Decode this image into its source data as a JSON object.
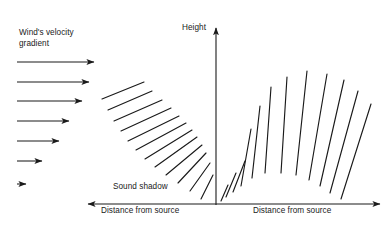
{
  "figure": {
    "title_absent": true,
    "background_color": "#ffffff",
    "stroke_color": "#1a1a1a",
    "text_color": "#1a1a1a"
  },
  "labels": {
    "wind_gradient": "Wind's velocity\ngradient",
    "height_axis": "Height",
    "sound_shadow": "Sound shadow",
    "distance_left": "Distance from source",
    "distance_right": "Distance from source"
  },
  "axes": {
    "vertical": {
      "x": 216,
      "y_top": 28,
      "y_bottom": 205,
      "arrow": "up",
      "label": "Height"
    },
    "horizontal_left": {
      "y": 204,
      "x_start": 216,
      "x_end": 88,
      "arrow": "left",
      "label": "Distance from source"
    },
    "horizontal_right": {
      "y": 204,
      "x_start": 216,
      "x_end": 380,
      "arrow": "right",
      "label": "Distance from source"
    }
  },
  "chart_data": {
    "type": "diagram",
    "wind_arrows": {
      "count": 7,
      "x_start": 17,
      "arrow_lengths": [
        77,
        72,
        65,
        52,
        42,
        25,
        9
      ],
      "y_positions": [
        62,
        82,
        101,
        121,
        141,
        161,
        184
      ],
      "meaning": "wind speed decreasing with decreasing height"
    },
    "left_fan": {
      "label": "Sound shadow",
      "ray_count": 12,
      "description": "Wavefront segments tilting from shallow at top-left to steep near the origin, bending upward away from the ground.",
      "rays": [
        {
          "x1": 102,
          "y1": 99,
          "x2": 144,
          "y2": 82
        },
        {
          "x1": 108,
          "y1": 110,
          "x2": 152,
          "y2": 91
        },
        {
          "x1": 114,
          "y1": 121,
          "x2": 162,
          "y2": 100
        },
        {
          "x1": 121,
          "y1": 131,
          "x2": 171,
          "y2": 108
        },
        {
          "x1": 128,
          "y1": 141,
          "x2": 179,
          "y2": 116
        },
        {
          "x1": 136,
          "y1": 150,
          "x2": 186,
          "y2": 123
        },
        {
          "x1": 145,
          "y1": 159,
          "x2": 192,
          "y2": 130
        },
        {
          "x1": 155,
          "y1": 167,
          "x2": 197,
          "y2": 137
        },
        {
          "x1": 166,
          "y1": 175,
          "x2": 202,
          "y2": 145
        },
        {
          "x1": 178,
          "y1": 183,
          "x2": 206,
          "y2": 153
        },
        {
          "x1": 190,
          "y1": 191,
          "x2": 210,
          "y2": 163
        },
        {
          "x1": 201,
          "y1": 199,
          "x2": 213,
          "y2": 175
        }
      ]
    },
    "right_fan": {
      "ray_count": 12,
      "origin": {
        "x": 219,
        "y": 203
      },
      "description": "Wavefront segments radiating from the source, arcing over and bending back down toward the ground downwind.",
      "rays": [
        {
          "x1": 221,
          "y1": 201,
          "x2": 228,
          "y2": 185
        },
        {
          "x1": 226,
          "y1": 197,
          "x2": 236,
          "y2": 173
        },
        {
          "x1": 233,
          "y1": 192,
          "x2": 245,
          "y2": 161
        },
        {
          "x1": 241,
          "y1": 186,
          "x2": 251,
          "y2": 129
        },
        {
          "x1": 252,
          "y1": 178,
          "x2": 260,
          "y2": 106
        },
        {
          "x1": 265,
          "y1": 173,
          "x2": 271,
          "y2": 87
        },
        {
          "x1": 281,
          "y1": 173,
          "x2": 287,
          "y2": 77
        },
        {
          "x1": 296,
          "y1": 175,
          "x2": 307,
          "y2": 71
        },
        {
          "x1": 309,
          "y1": 180,
          "x2": 327,
          "y2": 74
        },
        {
          "x1": 320,
          "y1": 186,
          "x2": 344,
          "y2": 80
        },
        {
          "x1": 330,
          "y1": 193,
          "x2": 358,
          "y2": 91
        },
        {
          "x1": 341,
          "y1": 199,
          "x2": 371,
          "y2": 104
        }
      ]
    }
  }
}
